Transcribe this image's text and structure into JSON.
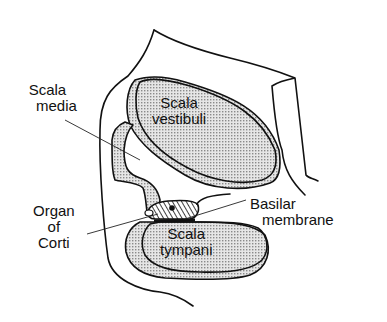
{
  "diagram": {
    "labels": {
      "scala_media": [
        "Scala",
        "media"
      ],
      "scala_vestibuli": [
        "Scala",
        "vestibuli"
      ],
      "organ_of_corti": [
        "Organ",
        "of",
        "Corti"
      ],
      "basilar_membrane": [
        "Basilar",
        "membrane"
      ],
      "scala_tympani": [
        "Scala",
        "tympani"
      ]
    },
    "colors": {
      "line": "#111111",
      "shading": "#9a9a9a",
      "background": "#ffffff"
    }
  }
}
